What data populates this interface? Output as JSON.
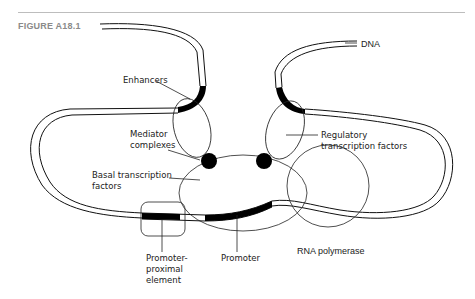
{
  "figure": {
    "label": "FIGURE A18.1"
  },
  "diagram": {
    "labels": {
      "dna": "DNA",
      "enhancers": "Enhancers",
      "mediator_line1": "Mediator",
      "mediator_line2": "complexes",
      "regulatory_line1": "Regulatory",
      "regulatory_line2": "transcription factors",
      "basal_line1": "Basal transcription",
      "basal_line2": "factors",
      "promoter_proximal_line1": "Promoter-",
      "promoter_proximal_line2": "proximal",
      "promoter_proximal_line3": "element",
      "promoter": "Promoter",
      "rna_polymerase": "RNA polymerase"
    }
  }
}
